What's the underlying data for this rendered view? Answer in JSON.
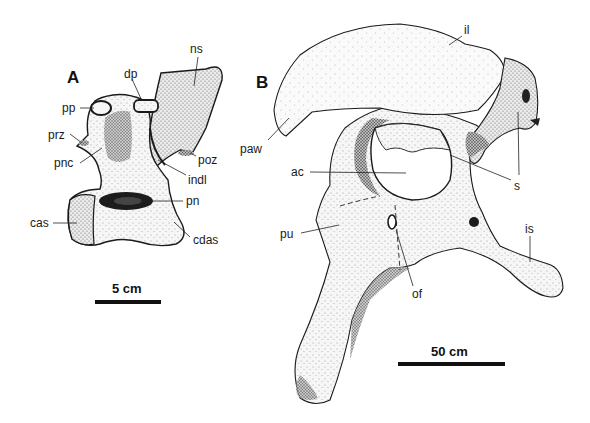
{
  "figure": {
    "panels": [
      {
        "id": "A",
        "label": "A",
        "subject": "vertebra",
        "scale_bar": {
          "label": "5 cm"
        },
        "annotations": [
          {
            "key": "ns",
            "text": "ns"
          },
          {
            "key": "dp",
            "text": "dp"
          },
          {
            "key": "pp",
            "text": "pp"
          },
          {
            "key": "prz",
            "text": "prz"
          },
          {
            "key": "pnc",
            "text": "pnc"
          },
          {
            "key": "poz",
            "text": "poz"
          },
          {
            "key": "indl",
            "text": "indl"
          },
          {
            "key": "pn",
            "text": "pn"
          },
          {
            "key": "cas",
            "text": "cas"
          },
          {
            "key": "cdas",
            "text": "cdas"
          }
        ]
      },
      {
        "id": "B",
        "label": "B",
        "subject": "pelvis",
        "scale_bar": {
          "label": "50 cm"
        },
        "annotations": [
          {
            "key": "il",
            "text": "il"
          },
          {
            "key": "paw",
            "text": "paw"
          },
          {
            "key": "ac",
            "text": "ac"
          },
          {
            "key": "s",
            "text": "s"
          },
          {
            "key": "pu",
            "text": "pu"
          },
          {
            "key": "of",
            "text": "of"
          },
          {
            "key": "is",
            "text": "is"
          }
        ]
      }
    ]
  }
}
